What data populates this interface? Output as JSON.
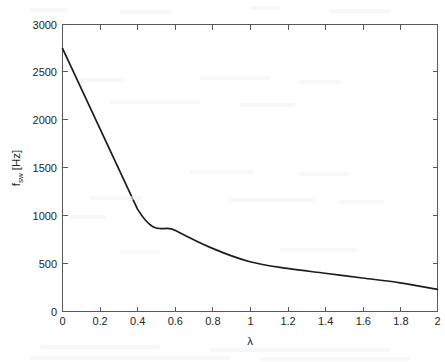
{
  "chart_data": {
    "type": "line",
    "title": "",
    "xlabel": "λ",
    "ylabel_main": "f",
    "ylabel_sub": "sw",
    "ylabel_unit": " [Hz]",
    "ylabel": "f_sw [Hz]",
    "x": [
      0,
      0.4,
      0.6,
      0.8,
      1.0,
      1.2,
      1.4,
      1.6,
      1.8,
      2.0
    ],
    "values": [
      2750,
      1070,
      850,
      660,
      520,
      450,
      400,
      350,
      300,
      230
    ],
    "series": [
      {
        "name": "f_sw",
        "values": [
          2750,
          1070,
          850,
          660,
          520,
          450,
          400,
          350,
          300,
          230
        ]
      }
    ],
    "xlim": [
      0,
      2
    ],
    "ylim": [
      0,
      3000
    ],
    "xticks": [
      0,
      0.2,
      0.4,
      0.6,
      0.8,
      1,
      1.2,
      1.4,
      1.6,
      1.8,
      2
    ],
    "xticklabels": [
      "0",
      "0.2",
      "0.4",
      "0.6",
      "0.8",
      "1",
      "1.2",
      "1.4",
      "1.6",
      "1.8",
      "2"
    ],
    "yticks": [
      0,
      500,
      1000,
      1500,
      2000,
      2500,
      3000
    ],
    "yticklabels": [
      "0",
      "500",
      "1000",
      "1500",
      "2000",
      "2500",
      "3000"
    ],
    "grid": false,
    "legend": null,
    "line_color": "#1d1d1d",
    "axis_color": "#555a5e",
    "background_color": "#fefefe"
  },
  "axes": {
    "x_title": "λ",
    "y_title_main": "f",
    "y_title_sub": "sw",
    "y_title_unit": " [Hz]"
  },
  "xticklabels": {
    "t0": "0",
    "t1": "0.2",
    "t2": "0.4",
    "t3": "0.6",
    "t4": "0.8",
    "t5": "1",
    "t6": "1.2",
    "t7": "1.4",
    "t8": "1.6",
    "t9": "1.8",
    "t10": "2"
  },
  "yticklabels": {
    "t0": "0",
    "t1": "500",
    "t2": "1000",
    "t3": "1500",
    "t4": "2000",
    "t5": "2500",
    "t6": "3000"
  }
}
